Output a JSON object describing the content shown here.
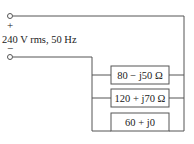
{
  "source": {
    "plus_sign": "+",
    "minus_sign": "−",
    "label": "240 V rms, 50 Hz"
  },
  "impedances": [
    {
      "label": "80 − j50 Ω"
    },
    {
      "label": "120 + j70 Ω"
    },
    {
      "label": "60 + j0"
    }
  ],
  "colors": {
    "wire": "#555555",
    "box_border": "#555555",
    "text": "#222222"
  }
}
